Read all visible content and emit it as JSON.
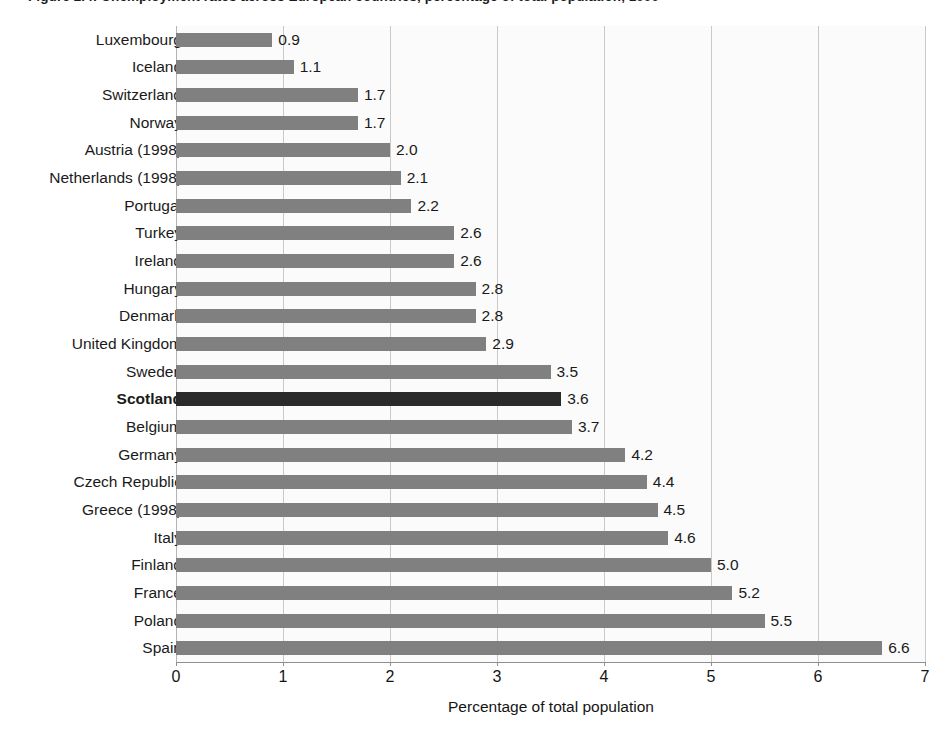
{
  "figure": {
    "title_clipped": "Figure 2.4:  Unemployment rates across European countries, percentage of total population, 1999",
    "highlight_category": "Scotland"
  },
  "chart_data": {
    "type": "bar",
    "orientation": "horizontal",
    "title": "",
    "xlabel": "Percentage of total population",
    "ylabel": "",
    "xlim": [
      0,
      7
    ],
    "xticks": [
      "0",
      "1",
      "2",
      "3",
      "4",
      "5",
      "6",
      "7"
    ],
    "grid": "vertical",
    "legend": "none",
    "bar_color": "#808080",
    "highlight_color": "#2a2a2a",
    "plot_background": "#fbfbfb",
    "categories": [
      "Luxembourg",
      "Iceland",
      "Switzerland",
      "Norway",
      "Austria (1998)",
      "Netherlands (1998)",
      "Portugal",
      "Turkey",
      "Ireland",
      "Hungary",
      "Denmark",
      "United Kingdom",
      "Sweden",
      "Scotland",
      "Belgium",
      "Germany",
      "Czech Republic",
      "Greece (1998)",
      "Italy",
      "Finland",
      "France",
      "Poland",
      "Spain"
    ],
    "values": [
      0.9,
      1.1,
      1.7,
      1.7,
      2.0,
      2.1,
      2.2,
      2.6,
      2.6,
      2.8,
      2.8,
      2.9,
      3.5,
      3.6,
      3.7,
      4.2,
      4.4,
      4.5,
      4.6,
      5.0,
      5.2,
      5.5,
      6.6
    ],
    "value_labels": [
      "0.9",
      "1.1",
      "1.7",
      "1.7",
      "2.0",
      "2.1",
      "2.2",
      "2.6",
      "2.6",
      "2.8",
      "2.8",
      "2.9",
      "3.5",
      "3.6",
      "3.7",
      "4.2",
      "4.4",
      "4.5",
      "4.6",
      "5.0",
      "5.2",
      "5.5",
      "6.6"
    ],
    "highlighted": [
      false,
      false,
      false,
      false,
      false,
      false,
      false,
      false,
      false,
      false,
      false,
      false,
      false,
      true,
      false,
      false,
      false,
      false,
      false,
      false,
      false,
      false,
      false
    ]
  }
}
